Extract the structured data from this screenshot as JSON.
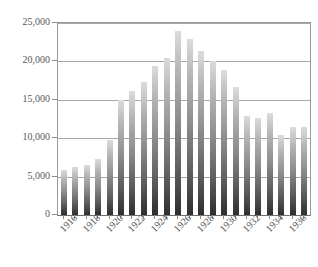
{
  "chart_data": {
    "type": "bar",
    "title": "",
    "subtitle": "",
    "xlabel": "",
    "ylabel": "",
    "grid": true,
    "legend": "none",
    "ylim": [
      0,
      25000
    ],
    "ytick_labels": [
      "0",
      "5,000",
      "10,000",
      "15,000",
      "20,000",
      "25,000"
    ],
    "ytick_values": [
      0,
      5000,
      10000,
      15000,
      20000,
      25000
    ],
    "xtick_labels": [
      "1916",
      "1918",
      "1920",
      "1922",
      "1924",
      "1926",
      "1928",
      "1930",
      "1932",
      "1934",
      "1936"
    ],
    "categories": [
      "1916",
      "1917",
      "1918",
      "1919",
      "1920",
      "1921",
      "1922",
      "1923",
      "1924",
      "1925",
      "1926",
      "1927",
      "1928",
      "1929",
      "1930",
      "1931",
      "1932",
      "1933",
      "1934",
      "1935",
      "1936",
      "1937"
    ],
    "values": [
      5900,
      6250,
      6550,
      7350,
      9800,
      15000,
      16200,
      17350,
      19350,
      20500,
      23950,
      22950,
      21300,
      20000,
      18850,
      16700,
      12900,
      12650,
      13250,
      10400,
      11500,
      11500
    ],
    "series": [
      {
        "name": "value",
        "values": [
          5900,
          6250,
          6550,
          7350,
          9800,
          15000,
          16200,
          17350,
          19350,
          20500,
          23950,
          22950,
          21300,
          20000,
          18850,
          16700,
          12900,
          12650,
          13250,
          10400,
          11500,
          11500
        ]
      }
    ],
    "colors": {
      "bar_top": "#dcdcdc",
      "bar_bottom": "#2e2e2e",
      "gridline": "#a8a8a8",
      "axis": "#8d8d8d",
      "text": "#58585a",
      "background": "#ffffff"
    }
  }
}
